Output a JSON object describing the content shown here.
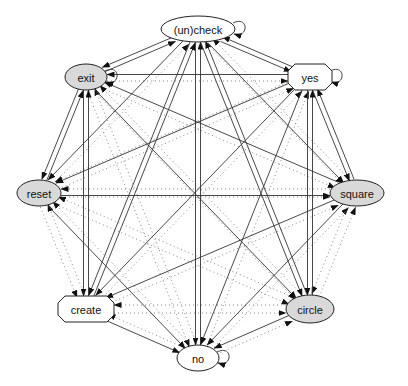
{
  "diagram": {
    "type": "directed-graph",
    "layout": "circular",
    "colors": {
      "background": "#ffffff",
      "node_white": "#ffffff",
      "node_gray": "#d9d9d9",
      "stroke": "#222222",
      "solid_edge": "#333333",
      "dotted_edge": "#888888"
    },
    "nodes": [
      {
        "id": "uncheck",
        "label": "(un)check",
        "shape": "ellipse",
        "fill": "white",
        "x": 198,
        "y": 29,
        "rx": 37,
        "ry": 13,
        "self_loop": true
      },
      {
        "id": "yes",
        "label": "yes",
        "shape": "octagon",
        "fill": "white",
        "x": 310,
        "y": 77,
        "rx": 22,
        "ry": 13,
        "self_loop": true
      },
      {
        "id": "square",
        "label": "square",
        "shape": "ellipse",
        "fill": "gray",
        "x": 357,
        "y": 193,
        "rx": 27,
        "ry": 13,
        "self_loop": false
      },
      {
        "id": "circle",
        "label": "circle",
        "shape": "ellipse",
        "fill": "gray",
        "x": 310,
        "y": 309,
        "rx": 24,
        "ry": 14,
        "self_loop": false
      },
      {
        "id": "no",
        "label": "no",
        "shape": "ellipse",
        "fill": "white",
        "x": 198,
        "y": 358,
        "rx": 21,
        "ry": 13,
        "self_loop": true
      },
      {
        "id": "create",
        "label": "create",
        "shape": "octagon",
        "fill": "white",
        "x": 86,
        "y": 309,
        "rx": 28,
        "ry": 13,
        "self_loop": false
      },
      {
        "id": "reset",
        "label": "reset",
        "shape": "ellipse",
        "fill": "gray",
        "x": 39,
        "y": 193,
        "rx": 22,
        "ry": 13,
        "self_loop": false
      },
      {
        "id": "exit",
        "label": "exit",
        "shape": "ellipse",
        "fill": "gray",
        "x": 86,
        "y": 77,
        "rx": 21,
        "ry": 13,
        "self_loop": true
      }
    ],
    "solid_edges": [
      [
        "uncheck",
        "exit"
      ],
      [
        "exit",
        "uncheck"
      ],
      [
        "uncheck",
        "yes"
      ],
      [
        "yes",
        "uncheck"
      ],
      [
        "uncheck",
        "reset"
      ],
      [
        "uncheck",
        "create"
      ],
      [
        "create",
        "uncheck"
      ],
      [
        "uncheck",
        "no"
      ],
      [
        "no",
        "uncheck"
      ],
      [
        "uncheck",
        "circle"
      ],
      [
        "circle",
        "uncheck"
      ],
      [
        "uncheck",
        "square"
      ],
      [
        "yes",
        "exit"
      ],
      [
        "yes",
        "reset"
      ],
      [
        "yes",
        "create"
      ],
      [
        "yes",
        "no"
      ],
      [
        "yes",
        "circle"
      ],
      [
        "circle",
        "yes"
      ],
      [
        "yes",
        "square"
      ],
      [
        "square",
        "yes"
      ],
      [
        "exit",
        "reset"
      ],
      [
        "reset",
        "exit"
      ],
      [
        "exit",
        "create"
      ],
      [
        "create",
        "exit"
      ],
      [
        "exit",
        "circle"
      ],
      [
        "square",
        "exit"
      ],
      [
        "reset",
        "no"
      ],
      [
        "reset",
        "square"
      ],
      [
        "create",
        "no"
      ],
      [
        "circle",
        "no"
      ],
      [
        "square",
        "no"
      ],
      [
        "square",
        "create"
      ]
    ],
    "dotted_edges": [
      [
        "exit",
        "yes"
      ],
      [
        "exit",
        "square"
      ],
      [
        "exit",
        "no"
      ],
      [
        "reset",
        "uncheck"
      ],
      [
        "reset",
        "yes"
      ],
      [
        "reset",
        "square"
      ],
      [
        "reset",
        "circle"
      ],
      [
        "reset",
        "create"
      ],
      [
        "create",
        "reset"
      ],
      [
        "create",
        "yes"
      ],
      [
        "create",
        "square"
      ],
      [
        "create",
        "circle"
      ],
      [
        "circle",
        "reset"
      ],
      [
        "circle",
        "create"
      ],
      [
        "circle",
        "square"
      ],
      [
        "circle",
        "exit"
      ],
      [
        "no",
        "exit"
      ],
      [
        "no",
        "reset"
      ],
      [
        "no",
        "create"
      ],
      [
        "no",
        "yes"
      ],
      [
        "no",
        "square"
      ],
      [
        "no",
        "circle"
      ],
      [
        "square",
        "reset"
      ],
      [
        "square",
        "circle"
      ],
      [
        "square",
        "uncheck"
      ],
      [
        "yes",
        "reset"
      ],
      [
        "uncheck",
        "square"
      ],
      [
        "exit",
        "circle"
      ]
    ]
  }
}
